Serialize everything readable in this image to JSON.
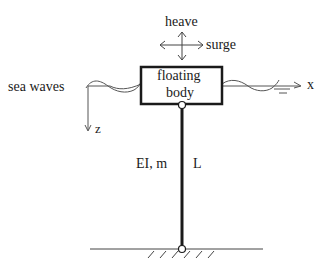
{
  "diagram": {
    "motion_labels": {
      "heave": "heave",
      "surge": "surge"
    },
    "body_label": {
      "line1": "floating",
      "line2": "body"
    },
    "sea_label": "sea waves",
    "axes": {
      "x": "x",
      "z": "z"
    },
    "column_labels": {
      "properties": "EI, m",
      "length": "L"
    },
    "colors": {
      "line": "#1a1a1a",
      "thin_line": "#555555",
      "background": "#ffffff"
    }
  }
}
